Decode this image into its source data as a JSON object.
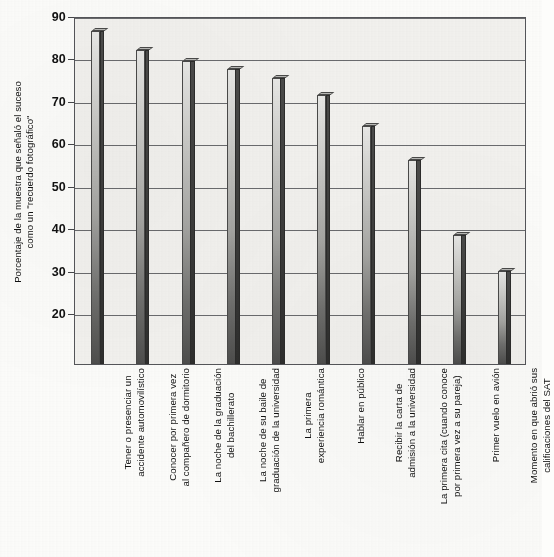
{
  "chart_data": {
    "type": "bar",
    "title": "",
    "subtitle": "",
    "xlabel": "",
    "ylabel": "Porcentaje de la muestra que señaló el suceso\ncomo un \"recuerdo fotográfico\"",
    "ylim": [
      8,
      90
    ],
    "yticks": [
      20,
      30,
      40,
      50,
      60,
      70,
      80,
      90
    ],
    "ytick_labels": [
      "20",
      "30",
      "40",
      "50",
      "60",
      "70",
      "80",
      "90"
    ],
    "grid": true,
    "legend": false,
    "legend_position": "none",
    "categories": [
      "Tener o presenciar un\naccidente automovilístico",
      "Conocer por primera vez\nal compañero de dormitorio",
      "La noche de la graduación\ndel bachillerato",
      "La noche de su baile de\ngraduación de la universidad",
      "La primera\nexperiencia romántica",
      "Hablar en público",
      "Recibir la carta de\nadmisión a la universidad",
      "La primera cita (cuando conoce\npor primera vez a su pareja)",
      "Primer vuelo en avión",
      "Momento en que abrió sus\ncalificaciones del SAT"
    ],
    "values": [
      86.5,
      82,
      79.5,
      77.5,
      75.5,
      71.5,
      64,
      56,
      38.5,
      30
    ],
    "bar_style": "3d-gradient-gray",
    "colors": {
      "bar_face_light": "#e9e9e7",
      "bar_face_dark": "#4e4e4d",
      "bar_side": "#3a3a39",
      "plot_background": "#f3f2ef",
      "gridline": "#6a6b6e",
      "axis": "#55565a",
      "page_background": "#fdfdfb",
      "text": "#111111"
    }
  }
}
